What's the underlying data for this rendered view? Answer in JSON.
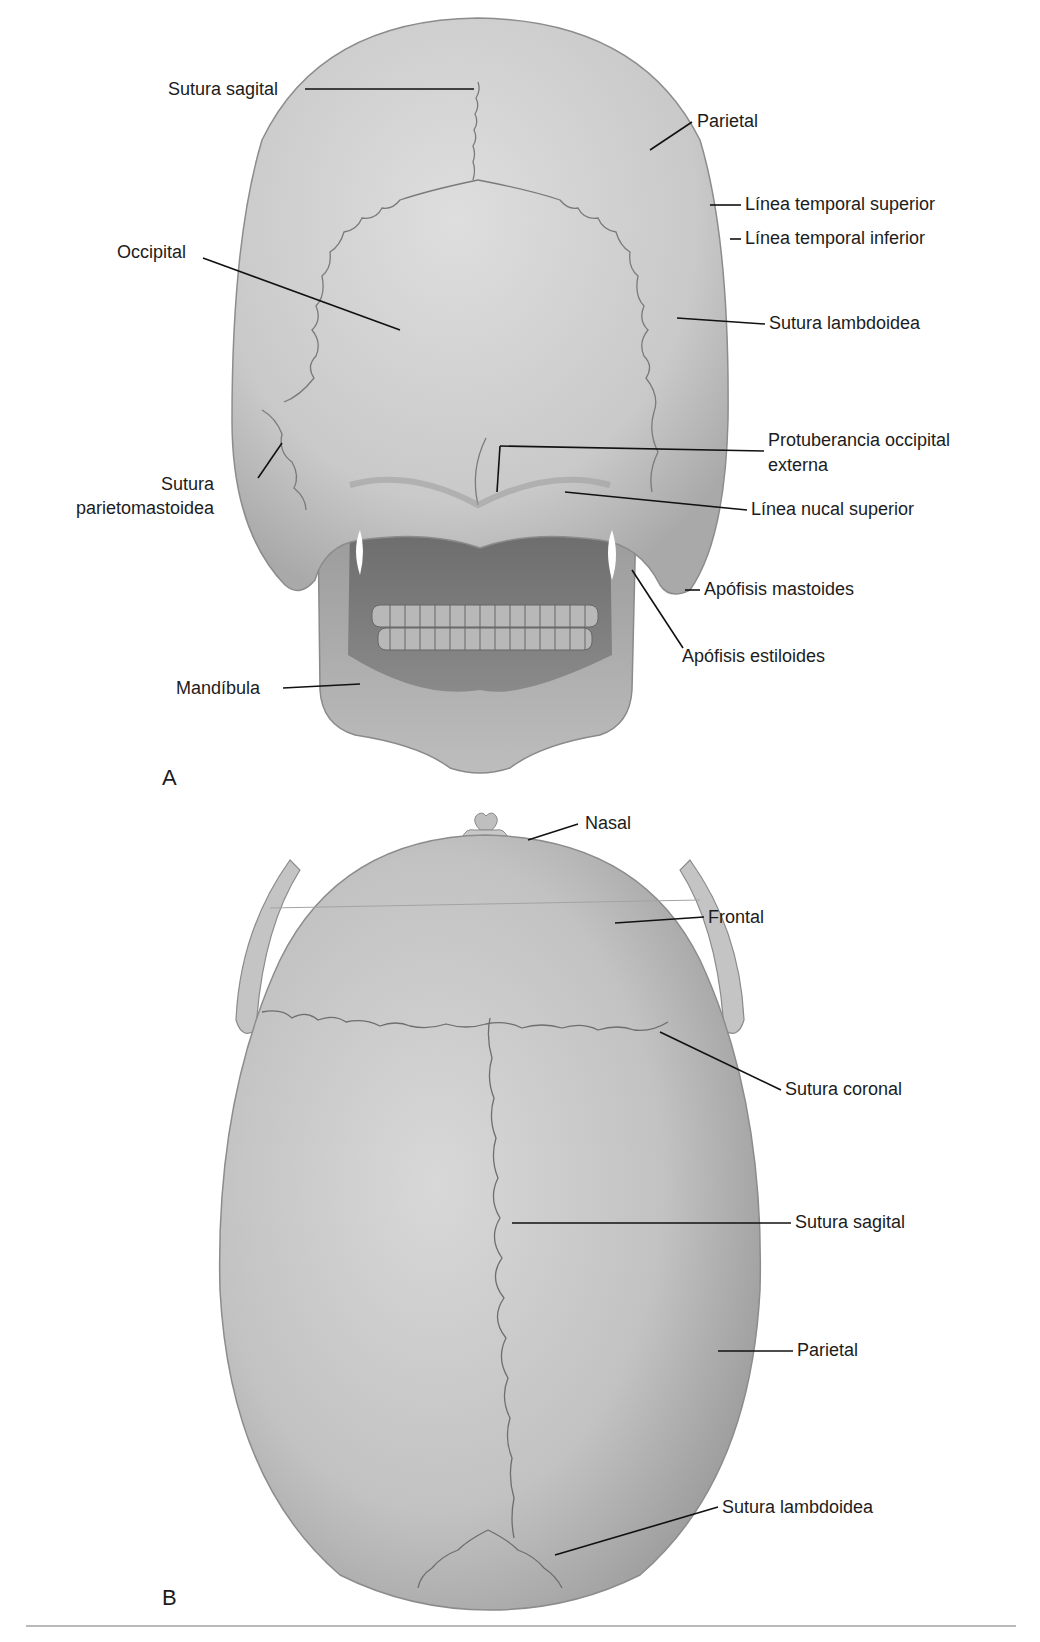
{
  "figure": {
    "panels": [
      {
        "letter": "A",
        "view": "posterior",
        "labels": [
          {
            "text": "Sutura sagital"
          },
          {
            "text": "Parietal"
          },
          {
            "text": "Línea temporal superior"
          },
          {
            "text": "Línea temporal inferior"
          },
          {
            "text": "Occipital"
          },
          {
            "text": "Sutura lambdoidea"
          },
          {
            "text_line1": "Protuberancia occipital",
            "text_line2": "externa"
          },
          {
            "text_line1": "Sutura",
            "text_line2": "parietomastoidea"
          },
          {
            "text": "Línea nucal superior"
          },
          {
            "text": "Apófisis mastoides"
          },
          {
            "text": "Apófisis estiloides"
          },
          {
            "text": "Mandíbula"
          }
        ]
      },
      {
        "letter": "B",
        "view": "superior",
        "labels": [
          {
            "text": "Nasal"
          },
          {
            "text": "Frontal"
          },
          {
            "text": "Sutura coronal"
          },
          {
            "text": "Sutura sagital"
          },
          {
            "text": "Parietal"
          },
          {
            "text": "Sutura lambdoidea"
          }
        ]
      }
    ],
    "colors": {
      "bone_light": "#d9d9d9",
      "bone_mid": "#bdbdbd",
      "bone_dark": "#8f8f8f",
      "suture": "#6e6e6e",
      "leader": "#111111",
      "background": "#ffffff"
    }
  }
}
